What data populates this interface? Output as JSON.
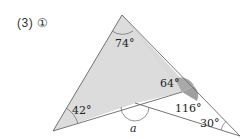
{
  "problem_label": "(3) ①",
  "figure": {
    "angles": {
      "top": "74°",
      "left": "42°",
      "inner_upper": "64°",
      "inner_lower": "116°",
      "right": "30°",
      "unknown": "a"
    },
    "colors": {
      "triangle_fill": "#d9d9d9",
      "highlight_fill": "#a8a8a8",
      "stroke": "#666666"
    }
  }
}
